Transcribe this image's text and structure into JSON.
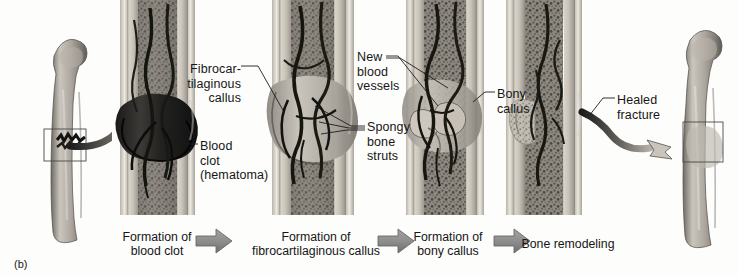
{
  "figure": {
    "label": "(b)",
    "background_color": "#fdfdfb",
    "ink_color": "#161616",
    "arrow_color": "#8e8e8e",
    "arrow_outline_color": "#6a6a6a"
  },
  "callouts": [
    {
      "id": "fibrocartilaginous-callus",
      "text": "Fibrocar-\ntilaginous\ncallus",
      "align": "right",
      "x": 186,
      "y": 62
    },
    {
      "id": "blood-clot",
      "text": "Blood\nclot\n(hematoma)",
      "align": "left",
      "x": 200,
      "y": 139
    },
    {
      "id": "new-blood-vessels",
      "text": "New\nblood\nvessels",
      "align": "left",
      "x": 357,
      "y": 50
    },
    {
      "id": "spongy-bone-struts",
      "text": "Spongy\nbone\nstruts",
      "align": "left",
      "x": 367,
      "y": 120
    },
    {
      "id": "bony-callus",
      "text": "Bony\ncallus",
      "align": "left",
      "x": 497,
      "y": 87
    },
    {
      "id": "healed-fracture",
      "text": "Healed\nfracture",
      "align": "left",
      "x": 617,
      "y": 93
    }
  ],
  "stages": [
    {
      "id": "stage-1",
      "caption": "Formation of\nblood clot",
      "x": 157,
      "y": 230
    },
    {
      "id": "stage-2",
      "caption": "Formation of\nfibrocartilaginous callus",
      "x": 316,
      "y": 230
    },
    {
      "id": "stage-3",
      "caption": "Formation of\nbony callus",
      "x": 447,
      "y": 230
    },
    {
      "id": "stage-4",
      "caption": "Bone remodeling",
      "x": 565,
      "y": 237
    }
  ],
  "stage_arrows": [
    {
      "id": "stage-arrow-1",
      "x": 196,
      "y": 232
    },
    {
      "id": "stage-arrow-2",
      "x": 378,
      "y": 232
    },
    {
      "id": "stage-arrow-3",
      "x": 494,
      "y": 232
    }
  ],
  "bones": {
    "whole_femur_left": {
      "id": "femur-fractured",
      "fracture_box": true
    },
    "whole_femur_right": {
      "id": "femur-healed",
      "fracture_box": true
    }
  },
  "panels": [
    {
      "id": "panel-hematoma"
    },
    {
      "id": "panel-fibrocartilaginous-callus"
    },
    {
      "id": "panel-bony-callus"
    },
    {
      "id": "panel-remodeling"
    }
  ]
}
